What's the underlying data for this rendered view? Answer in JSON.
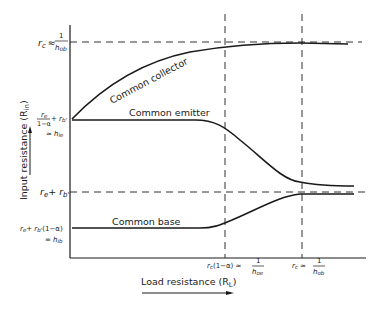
{
  "diagram": {
    "y_axis_label": "Input resistance (R",
    "y_axis_sub": "in",
    "y_axis_close": ")",
    "x_axis_label": "Load resistance (R",
    "x_axis_sub": "L",
    "x_axis_close": ")",
    "curves": {
      "common_collector": "Common collector",
      "common_emitter": "Common emitter",
      "common_base": "Common base"
    },
    "y_levels": {
      "top": {
        "main": "r",
        "sub": "c",
        "approx": "≈",
        "num": "1",
        "den": "h",
        "den_sub": "ob"
      },
      "emitter": {
        "line1": "r",
        "line1_sub": "e",
        "frac_den": "1−α",
        "plus": "+ r",
        "plus_sub": "b'",
        "approx": "≈ h",
        "approx_sub": "ie"
      },
      "mid": {
        "text": "r",
        "sub": "e",
        "plus": "+ r",
        "plus_sub": "b'"
      },
      "base": {
        "line1": "r",
        "line1_sub": "e",
        "plus": "+ r",
        "plus_sub": "b'",
        "tail": "(1−α)",
        "eq": "= h",
        "eq_sub": "ib"
      }
    },
    "x_marks": {
      "left": {
        "main": "r",
        "sub": "c",
        "tail": "(1−α) ≈",
        "num": "1",
        "den": "h",
        "den_sub": "oe"
      },
      "right": {
        "main": "r",
        "sub": "c",
        "tail": "≈",
        "num": "1",
        "den": "h",
        "den_sub": "ob"
      }
    },
    "colors": {
      "ink": "#1a1a1a",
      "background": "#ffffff"
    }
  }
}
